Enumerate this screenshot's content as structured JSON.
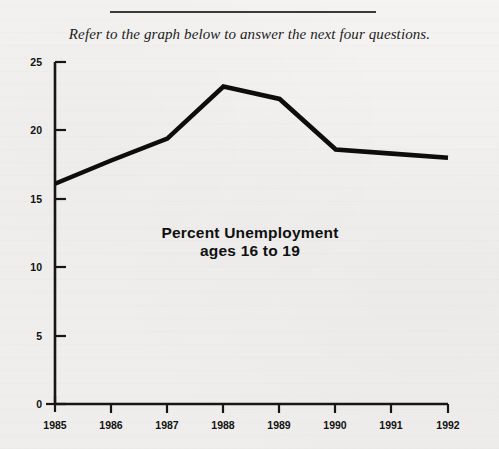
{
  "page": {
    "instruction": "Refer to the graph below to answer the next four questions.",
    "divider": "horizontal-rule"
  },
  "chart_data": {
    "type": "line",
    "title": "Percent Unemployment",
    "subtitle": "ages 16 to 19",
    "xlabel": "",
    "ylabel": "",
    "categories": [
      "1985",
      "1986",
      "1987",
      "1988",
      "1989",
      "1990",
      "1991",
      "1992"
    ],
    "x": [
      1985,
      1986,
      1987,
      1988,
      1989,
      1990,
      1991,
      1992
    ],
    "values": [
      16.1,
      17.8,
      19.4,
      23.2,
      22.3,
      18.6,
      18.3,
      18.0
    ],
    "series": [
      {
        "name": "Percent Unemployment ages 16 to 19",
        "values": [
          16.1,
          17.8,
          19.4,
          23.2,
          22.3,
          18.6,
          18.3,
          18.0
        ]
      }
    ],
    "ylim": [
      0,
      25
    ],
    "xlim": [
      1985,
      1992
    ],
    "yticks": [
      0,
      5,
      10,
      15,
      20,
      25
    ],
    "ytick_labels": [
      "0",
      "5",
      "10",
      "15",
      "20",
      "25"
    ],
    "xtick_labels": [
      "1985",
      "1986",
      "1987",
      "1988",
      "1989",
      "1990",
      "1991",
      "1992"
    ],
    "grid": false,
    "legend": false,
    "line_color": "#0d0d0d",
    "axis_color": "#161616",
    "background": "#f2f1ef"
  }
}
